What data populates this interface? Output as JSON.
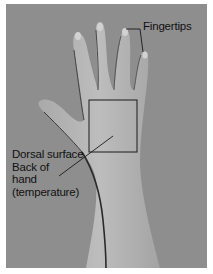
{
  "figure": {
    "background_color": "#8e8e8e",
    "skin_color": "#b9b9b9",
    "annotations": {
      "fingertips": "Fingertips",
      "dorsal_line1": "Dorsal surface",
      "dorsal_line2": "Back of",
      "dorsal_line3": "hand",
      "dorsal_line4": "(temperature)"
    },
    "box": {
      "x": 89,
      "y": 100,
      "width": 48,
      "height": 52
    }
  }
}
